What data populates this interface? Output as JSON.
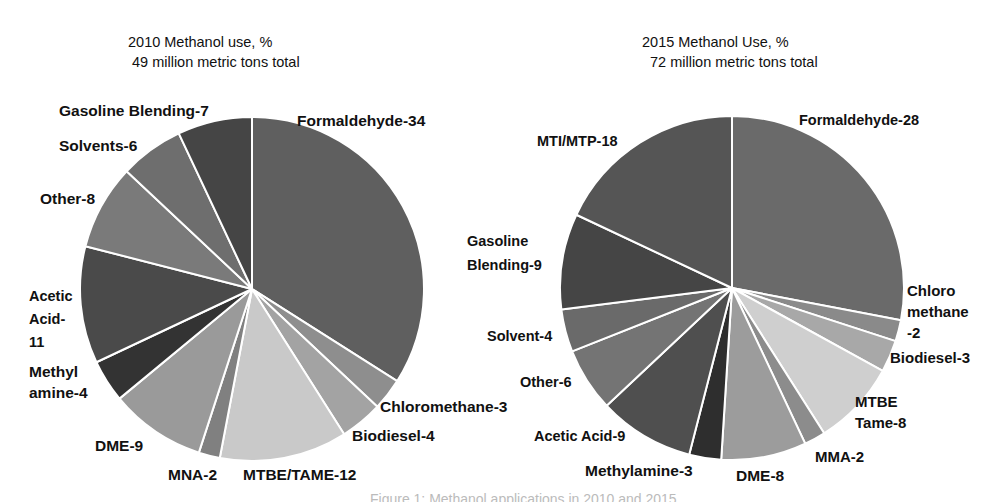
{
  "chart_data": [
    {
      "type": "pie",
      "title": "2010 Methanol use, %",
      "subtitle": "49 million  metric tons total",
      "start_angle": "12 o'clock",
      "direction": "clockwise",
      "categories": [
        "Formaldehyde",
        "Chloromethane",
        "Biodiesel",
        "MTBE/TAME",
        "MNA",
        "DME",
        "Methylamine",
        "Acetic Acid",
        "Other",
        "Solvents",
        "Gasoline Blending"
      ],
      "values": [
        34,
        3,
        4,
        12,
        2,
        9,
        4,
        11,
        8,
        6,
        7
      ],
      "labels": [
        "Formaldehyde-34",
        "Chloromethane-3",
        "Biodiesel-4",
        "MTBE/TAME-12",
        "MNA-2",
        "DME-9",
        "Methyl amine-4",
        "Acetic Acid- 11",
        "Other-8",
        "Solvents-6",
        "Gasoline Blending-7"
      ],
      "colors": [
        "#5f5f5f",
        "#8e8e8e",
        "#a3a3a3",
        "#c9c9c9",
        "#808080",
        "#9a9a9a",
        "#333333",
        "#4a4a4a",
        "#7a7a7a",
        "#6e6e6e",
        "#454545"
      ]
    },
    {
      "type": "pie",
      "title": "2015 Methanol Use, %",
      "subtitle": "72 million metric tons total",
      "start_angle": "12 o'clock",
      "direction": "clockwise",
      "categories": [
        "Formaldehyde",
        "Chloromethane",
        "Biodiesel",
        "MTBE Tame",
        "MMA",
        "DME",
        "Methylamine",
        "Acetic Acid",
        "Other",
        "Solvent",
        "Gasoline Blending",
        "MTI/MTP"
      ],
      "values": [
        28,
        2,
        3,
        8,
        2,
        8,
        3,
        9,
        6,
        4,
        9,
        18
      ],
      "labels": [
        "Formaldehyde-28",
        "Chloro methane -2",
        "Biodiesel-3",
        "MTBE Tame-8",
        "MMA-2",
        "DME-8",
        "Methylamine-3",
        "Acetic Acid-9",
        "Other-6",
        "Solvent-4",
        "Gasoline Blending-9",
        "MTI/MTP-18"
      ],
      "colors": [
        "#6a6a6a",
        "#8a8a8a",
        "#a8a8a8",
        "#cfcfcf",
        "#8c8c8c",
        "#9c9c9c",
        "#2e2e2e",
        "#4f4f4f",
        "#747474",
        "#6a6a6a",
        "#454545",
        "#555555"
      ]
    }
  ],
  "left": {
    "title_line1": "2010 Methanol use, %",
    "title_line2": "49 million  metric tons total",
    "labels": {
      "formaldehyde": "Formaldehyde-34",
      "chloromethane": "Chloromethane-3",
      "biodiesel": "Biodiesel-4",
      "mtbe": "MTBE/TAME-12",
      "mna": "MNA-2",
      "dme": "DME-9",
      "methylamine_1": "Methyl",
      "methylamine_2": "amine-4",
      "acetic_1": "Acetic",
      "acetic_2": "Acid-",
      "acetic_3": "11",
      "other": "Other-8",
      "solvents": "Solvents-6",
      "gasoline": "Gasoline Blending-7"
    }
  },
  "right": {
    "title_line1": "2015 Methanol Use, %",
    "title_line2": "72 million metric tons total",
    "labels": {
      "formaldehyde": "Formaldehyde-28",
      "chloro_1": "Chloro",
      "chloro_2": "methane",
      "chloro_3": "-2",
      "biodiesel": "Biodiesel-3",
      "mtbe_1": "MTBE",
      "mtbe_2": "Tame-8",
      "mma": "MMA-2",
      "dme": "DME-8",
      "methylamine": "Methylamine-3",
      "acetic": "Acetic Acid-9",
      "other": "Other-6",
      "solvent": "Solvent-4",
      "gasoline_1": "Gasoline",
      "gasoline_2": "Blending-9",
      "mti": "MTI/MTP-18"
    }
  },
  "caption": "Figure 1: Methanol applications in 2010 and 2015"
}
